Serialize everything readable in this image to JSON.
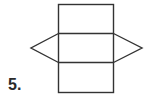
{
  "problem": {
    "number_label": "5."
  },
  "diagram": {
    "stroke_color": "#333333",
    "stroke_width": 1.4,
    "rectangle": {
      "x": 58.5,
      "y": 4.5,
      "width": 55,
      "height": 88
    },
    "dividers_y": [
      33.5,
      62.5
    ],
    "left_triangle": "58.5,33.5 31,48 58.5,62.5",
    "right_triangle": "113.5,33.5 142,48 113.5,62.5"
  }
}
